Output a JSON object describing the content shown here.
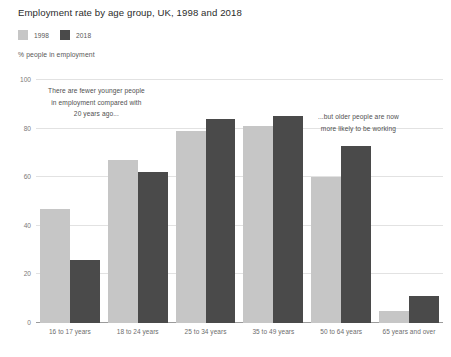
{
  "chart_data": {
    "type": "bar",
    "title": "Employment rate by age group, UK, 1998 and 2018",
    "subtitle": "% people in employment",
    "xlabel": "",
    "ylabel": "% people in employment",
    "ylim": [
      0,
      100
    ],
    "yticks": [
      0,
      20,
      40,
      60,
      80,
      100
    ],
    "grid": true,
    "legend_position": "top-left",
    "categories": [
      "16 to 17 years",
      "18 to 24 years",
      "25 to 34 years",
      "35 to 49 years",
      "50 to 64 years",
      "65 years and over"
    ],
    "series": [
      {
        "name": "1998",
        "color": "#c6c6c6",
        "values": [
          47,
          67,
          79,
          81,
          60,
          5
        ]
      },
      {
        "name": "2018",
        "color": "#4a4a4a",
        "values": [
          26,
          62,
          84,
          85,
          73,
          11
        ]
      }
    ],
    "annotations": [
      {
        "id": "left",
        "lines": [
          "There are fewer younger people",
          "in employment compared with",
          "20 years ago..."
        ]
      },
      {
        "id": "right",
        "lines": [
          "...but older people are now",
          "more likely to be working"
        ]
      }
    ]
  }
}
